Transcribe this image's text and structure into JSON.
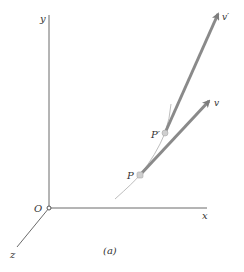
{
  "diagram": {
    "caption": "(a)",
    "axes": {
      "x_label": "x",
      "y_label": "y",
      "z_label": "z",
      "origin_label": "O"
    },
    "points": {
      "p_label": "P",
      "p_prime_label": "P′"
    },
    "vectors": {
      "v_label": "v",
      "v_prime_label": "v′"
    },
    "colors": {
      "axis": "#555555",
      "vector": "#8a8a8a",
      "curve": "#b5b5b5",
      "point_fill": "#cfcfcf",
      "text": "#333333"
    }
  }
}
